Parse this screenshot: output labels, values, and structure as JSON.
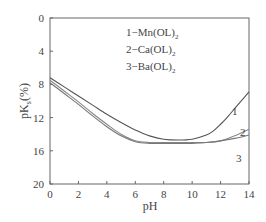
{
  "chart_data": {
    "type": "line",
    "title": "",
    "xlabel": "pH",
    "ylabel": "pKs(%)",
    "ylabel_main": "pK",
    "ylabel_sub": "s",
    "ylabel_suffix": "(%)",
    "xlim": [
      0,
      14
    ],
    "ylim": [
      20,
      0
    ],
    "y_inverted": true,
    "grid": false,
    "x_ticks": [
      0,
      2,
      4,
      6,
      8,
      10,
      12,
      14
    ],
    "y_ticks": [
      0,
      4,
      8,
      12,
      16,
      20
    ],
    "legend": {
      "position": "upper-center",
      "entries": [
        {
          "num": "1",
          "label": "1−Mn(OL)",
          "sub": "2"
        },
        {
          "num": "2",
          "label": "2−Ca(OL)",
          "sub": "2"
        },
        {
          "num": "3",
          "label": "3−Ba(OL)",
          "sub": "2"
        }
      ]
    },
    "series": [
      {
        "name": "1-Mn(OL)2",
        "line_label": "1",
        "x": [
          0,
          1,
          2,
          3,
          4,
          5,
          6,
          7,
          8,
          9,
          10,
          11,
          11.5,
          12,
          12.5,
          13,
          13.5,
          14
        ],
        "y": [
          7.2,
          8.3,
          9.4,
          10.5,
          11.6,
          12.6,
          13.5,
          14.2,
          14.6,
          14.7,
          14.6,
          14.1,
          13.6,
          12.8,
          11.9,
          10.9,
          9.9,
          8.9
        ]
      },
      {
        "name": "2-Ca(OL)2",
        "line_label": "2",
        "x": [
          0,
          1,
          2,
          3,
          4,
          5,
          6,
          7,
          8,
          9,
          10,
          11,
          12,
          13,
          14
        ],
        "y": [
          7.5,
          8.8,
          10.1,
          11.5,
          12.8,
          14.0,
          14.8,
          15.0,
          15.0,
          15.0,
          15.0,
          15.0,
          14.8,
          14.2,
          13.4
        ]
      },
      {
        "name": "3-Ba(OL)2",
        "line_label": "3",
        "x": [
          0,
          1,
          2,
          3,
          4,
          5,
          6,
          7,
          8,
          9,
          10,
          11,
          12,
          13,
          14
        ],
        "y": [
          7.8,
          9.1,
          10.4,
          11.8,
          13.1,
          14.2,
          14.9,
          15.1,
          15.1,
          15.1,
          15.1,
          15.0,
          14.8,
          14.5,
          14.1
        ]
      }
    ]
  }
}
